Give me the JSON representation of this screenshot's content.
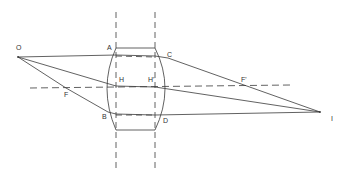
{
  "diagram": {
    "labels": {
      "O": "O",
      "A": "A",
      "C": "C",
      "H": "H",
      "H_prime": "H'",
      "F": "F",
      "F_prime": "F'",
      "B": "B",
      "D": "D",
      "I": "I"
    },
    "colors": {
      "line": "#3a3a3a",
      "background": "#ffffff"
    }
  }
}
